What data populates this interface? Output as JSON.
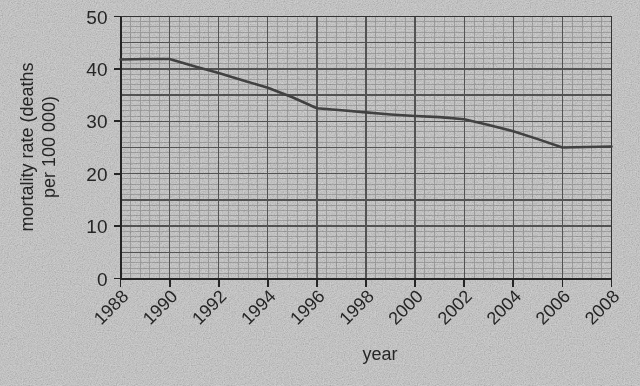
{
  "chart_data": {
    "type": "line",
    "title": "",
    "xlabel": "year",
    "ylabel": "mortality rate (deaths per 100 000)",
    "ylabel_line1": "mortality rate (deaths",
    "ylabel_line2": "per 100 000)",
    "xlim": [
      1988,
      2008
    ],
    "ylim": [
      0,
      50
    ],
    "ytick_labels": [
      "50",
      "40",
      "30",
      "20",
      "10",
      "0"
    ],
    "ytick_values": [
      50,
      40,
      30,
      20,
      10,
      0
    ],
    "xtick_labels": [
      "1988",
      "1990",
      "1992",
      "1994",
      "1996",
      "1998",
      "2000",
      "2002",
      "2004",
      "2006",
      "2008"
    ],
    "xtick_values": [
      1988,
      1990,
      1992,
      1994,
      1996,
      1998,
      2000,
      2002,
      2004,
      2006,
      2008
    ],
    "xtick_rotation_deg": 45,
    "grid": true,
    "grid_minor_step_x": 0.4,
    "grid_minor_step_y": 1,
    "grid_major_step_x": 2,
    "grid_major_step_y": 5,
    "legend": "none",
    "line_color": "#4a4a4a",
    "grid_minor_color": "#a8a8a8",
    "grid_major_color": "#5e5e5e",
    "axis_color": "#2a2a2a",
    "background_color": "#dcdcdc",
    "x": [
      1988,
      1989,
      1990,
      1991,
      1992,
      1993,
      1994,
      1995,
      1996,
      1997,
      1998,
      1999,
      2000,
      2001,
      2002,
      2003,
      2004,
      2005,
      2006,
      2007,
      2008
    ],
    "values": [
      41.8,
      41.9,
      41.9,
      40.5,
      39.2,
      37.8,
      36.4,
      34.6,
      32.5,
      32.1,
      31.7,
      31.3,
      31.0,
      30.8,
      30.4,
      29.3,
      28.1,
      26.6,
      25.0,
      25.1,
      25.2
    ],
    "series": [
      {
        "name": "mortality rate",
        "values": [
          41.8,
          41.9,
          41.9,
          40.5,
          39.2,
          37.8,
          36.4,
          34.6,
          32.5,
          32.1,
          31.7,
          31.3,
          31.0,
          30.8,
          30.4,
          29.3,
          28.1,
          26.6,
          25.0,
          25.1,
          25.2
        ]
      }
    ],
    "annotations": []
  }
}
